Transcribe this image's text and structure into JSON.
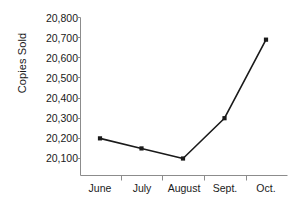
{
  "chart_data": {
    "type": "line",
    "title": "",
    "subtitle": "",
    "xlabel": "",
    "ylabel": "Copies Sold",
    "categories": [
      "June",
      "July",
      "August",
      "Sept.",
      "Oct."
    ],
    "values": [
      20200,
      20150,
      20100,
      20300,
      20690
    ],
    "series": [
      {
        "name": "Copies Sold",
        "values": [
          20200,
          20150,
          20100,
          20300,
          20690
        ]
      }
    ],
    "ylim": [
      20100,
      20800
    ],
    "ytick_values": [
      20100,
      20200,
      20300,
      20400,
      20500,
      20600,
      20700,
      20800
    ],
    "ytick_labels": [
      "20,100",
      "20,200",
      "20,300",
      "20,400",
      "20,500",
      "20,600",
      "20,700",
      "20,800"
    ],
    "grid": false,
    "legend": false,
    "legend_position": "none",
    "marker": "filled-square",
    "line_color": "#1a1a1a",
    "marker_color": "#1a1a1a",
    "axis_color": "#8c8c8c",
    "background_color": "#ffffff"
  },
  "axes": {
    "y_title": "Copies Sold",
    "y_labels": [
      "20,800",
      "20,700",
      "20,600",
      "20,500",
      "20,400",
      "20,300",
      "20,200",
      "20,100"
    ],
    "x_labels": [
      "June",
      "July",
      "August",
      "Sept.",
      "Oct."
    ]
  }
}
